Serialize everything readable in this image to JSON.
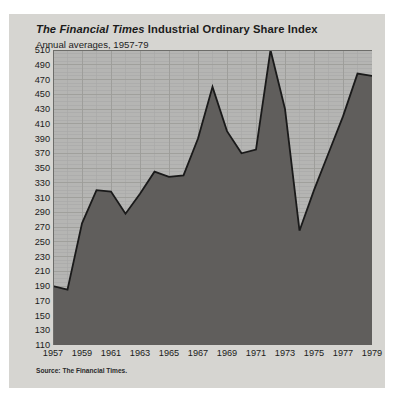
{
  "figure": {
    "title_em": "The Financial Times",
    "title_rest": " Industrial Ordinary Share Index",
    "title_full": "The Financial Times Industrial Ordinary Share Index",
    "subtitle": "Annual averages, 1957-79",
    "source_prefix": "Source: ",
    "source_name": "The Financial Times.",
    "background_color": "#d6d5d1",
    "plot_background_color": "#b5b5b3",
    "area_fill_color": "#605e5c",
    "line_color": "#1a1a1a",
    "grid_color": "#9c9c99",
    "text_color": "#1b1b1b"
  },
  "chart_data": {
    "type": "area",
    "title": "The Financial Times Industrial Ordinary Share Index",
    "subtitle": "Annual averages, 1957-79",
    "xlabel": "",
    "ylabel": "",
    "grid": true,
    "legend": "none",
    "xlim": [
      1957,
      1979
    ],
    "ylim": [
      110,
      510
    ],
    "ytick_step": 20,
    "xtick_step": 2,
    "x": [
      1957,
      1958,
      1959,
      1960,
      1961,
      1962,
      1963,
      1964,
      1965,
      1966,
      1967,
      1968,
      1969,
      1970,
      1971,
      1972,
      1973,
      1974,
      1975,
      1976,
      1977,
      1978,
      1979
    ],
    "values": [
      190,
      185,
      275,
      320,
      318,
      288,
      315,
      345,
      338,
      340,
      390,
      460,
      400,
      370,
      375,
      510,
      430,
      265,
      320,
      370,
      420,
      478,
      475
    ],
    "yticks": [
      110,
      130,
      150,
      170,
      190,
      210,
      230,
      250,
      270,
      290,
      310,
      330,
      350,
      370,
      390,
      410,
      430,
      450,
      470,
      490,
      510
    ],
    "xticks": [
      1957,
      1959,
      1961,
      1963,
      1965,
      1967,
      1969,
      1971,
      1973,
      1975,
      1977,
      1979
    ],
    "source": "Source: The Financial Times."
  }
}
